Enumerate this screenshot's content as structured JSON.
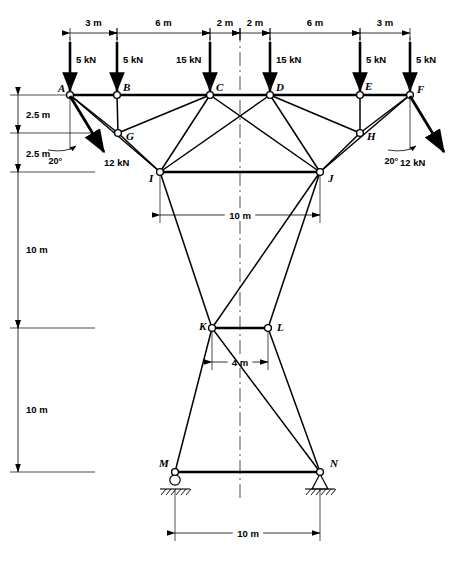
{
  "diagram": {
    "units": "m",
    "force_unit": "kN"
  },
  "joints": [
    {
      "id": "A",
      "label": "A",
      "x": 70,
      "y": 95,
      "label_dx": -12,
      "label_dy": -3
    },
    {
      "id": "B",
      "label": "B",
      "x": 117,
      "y": 95,
      "label_dx": 6,
      "label_dy": -4
    },
    {
      "id": "C",
      "label": "C",
      "x": 210,
      "y": 95,
      "label_dx": 6,
      "label_dy": -4
    },
    {
      "id": "D",
      "label": "D",
      "x": 270,
      "y": 95,
      "label_dx": 6,
      "label_dy": -4
    },
    {
      "id": "E",
      "label": "E",
      "x": 360,
      "y": 95,
      "label_dx": 5,
      "label_dy": -5
    },
    {
      "id": "F",
      "label": "F",
      "x": 410,
      "y": 95,
      "label_dx": 7,
      "label_dy": -2
    },
    {
      "id": "G",
      "label": "G",
      "x": 118,
      "y": 133,
      "label_dx": 8,
      "label_dy": 7
    },
    {
      "id": "H",
      "label": "H",
      "x": 360,
      "y": 133,
      "label_dx": 7,
      "label_dy": 7
    },
    {
      "id": "I",
      "label": "I",
      "x": 160,
      "y": 172,
      "label_dx": -11,
      "label_dy": 10
    },
    {
      "id": "J",
      "label": "J",
      "x": 320,
      "y": 172,
      "label_dx": 8,
      "label_dy": 10
    },
    {
      "id": "K",
      "label": "K",
      "x": 212,
      "y": 328,
      "label_dx": -13,
      "label_dy": 2
    },
    {
      "id": "L",
      "label": "L",
      "x": 268,
      "y": 328,
      "label_dx": 9,
      "label_dy": 3
    },
    {
      "id": "M",
      "label": "M",
      "x": 175,
      "y": 472,
      "label_dx": -16,
      "label_dy": -5
    },
    {
      "id": "N",
      "label": "N",
      "x": 320,
      "y": 472,
      "label_dx": 10,
      "label_dy": -5
    }
  ],
  "chord_members": [
    {
      "from": "A",
      "to": "B"
    },
    {
      "from": "B",
      "to": "C"
    },
    {
      "from": "C",
      "to": "D"
    },
    {
      "from": "D",
      "to": "E"
    },
    {
      "from": "E",
      "to": "F"
    },
    {
      "from": "I",
      "to": "J"
    },
    {
      "from": "K",
      "to": "L"
    },
    {
      "from": "M",
      "to": "N"
    }
  ],
  "web_members": [
    {
      "from": "A",
      "to": "G"
    },
    {
      "from": "A",
      "to": "I"
    },
    {
      "from": "B",
      "to": "G"
    },
    {
      "from": "G",
      "to": "C"
    },
    {
      "from": "G",
      "to": "I"
    },
    {
      "from": "C",
      "to": "I"
    },
    {
      "from": "C",
      "to": "J"
    },
    {
      "from": "D",
      "to": "I"
    },
    {
      "from": "D",
      "to": "J"
    },
    {
      "from": "D",
      "to": "H"
    },
    {
      "from": "E",
      "to": "H"
    },
    {
      "from": "F",
      "to": "H"
    },
    {
      "from": "F",
      "to": "J"
    },
    {
      "from": "H",
      "to": "J"
    },
    {
      "from": "I",
      "to": "K"
    },
    {
      "from": "J",
      "to": "L"
    },
    {
      "from": "J",
      "to": "K"
    },
    {
      "from": "K",
      "to": "M"
    },
    {
      "from": "K",
      "to": "N"
    },
    {
      "from": "L",
      "to": "N"
    }
  ],
  "vertical_loads": [
    {
      "joint": "A",
      "value": "5 kN",
      "x": 70,
      "label_x": 76,
      "label_y": 63
    },
    {
      "joint": "B",
      "value": "5 kN",
      "x": 117,
      "label_x": 123,
      "label_y": 63
    },
    {
      "joint": "C",
      "value": "15 kN",
      "x": 210,
      "label_x": 176,
      "label_y": 63
    },
    {
      "joint": "D",
      "value": "15 kN",
      "x": 270,
      "label_x": 276,
      "label_y": 63
    },
    {
      "joint": "E",
      "value": "5 kN",
      "x": 360,
      "label_x": 366,
      "label_y": 63
    },
    {
      "joint": "F",
      "value": "5 kN",
      "x": 410,
      "label_x": 416,
      "label_y": 63
    }
  ],
  "oblique_loads": [
    {
      "joint": "A",
      "value": "12 kN",
      "angle_label": "20°",
      "x1": 70,
      "y1": 96,
      "x2": 104,
      "y2": 152,
      "value_x": 104,
      "value_y": 166,
      "angle_x": 62,
      "angle_y": 152
    },
    {
      "joint": "F",
      "value": "12 kN",
      "angle_label": "20°",
      "x1": 410,
      "y1": 96,
      "x2": 444,
      "y2": 152,
      "value_x": 400,
      "value_y": 166,
      "angle_x": 398,
      "angle_y": 152
    }
  ],
  "top_dimensions": {
    "y_line": 33,
    "segments": [
      {
        "label": "3 m",
        "x1": 70,
        "x2": 117
      },
      {
        "label": "6 m",
        "x1": 117,
        "x2": 210
      },
      {
        "label": "2 m",
        "x1": 210,
        "x2": 240
      },
      {
        "label": "2 m",
        "x1": 240,
        "x2": 270
      },
      {
        "label": "6 m",
        "x1": 270,
        "x2": 360
      },
      {
        "label": "3 m",
        "x1": 360,
        "x2": 410
      }
    ]
  },
  "left_dimensions": {
    "x_line": 18,
    "segments": [
      {
        "label": "2.5 m",
        "y1": 95,
        "y2": 133,
        "label_y": 118,
        "tick_len": 95
      },
      {
        "label": "2.5 m",
        "y1": 133,
        "y2": 172,
        "label_y": 157,
        "tick_len": 95
      },
      {
        "label": "10 m",
        "y1": 172,
        "y2": 328,
        "label_y": 253,
        "tick_len": 95
      },
      {
        "label": "10 m",
        "y1": 328,
        "y2": 472,
        "label_y": 413,
        "tick_len": 95
      }
    ]
  },
  "internal_dimensions": [
    {
      "label": "10 m",
      "x1": 160,
      "x2": 320,
      "y": 215,
      "ext_from_y": 174,
      "text_x": 240,
      "text_y": 218
    },
    {
      "label": "4 m",
      "x1": 212,
      "x2": 268,
      "y": 362,
      "ext_from_y": 330,
      "text_x": 240,
      "text_y": 365
    },
    {
      "label": "10 m",
      "x1": 175,
      "x2": 320,
      "y": 533,
      "ext_from_y": 490,
      "text_x": 248,
      "text_y": 536
    }
  ],
  "centerline": {
    "x": 240,
    "y1": 28,
    "y2": 500
  },
  "supports": [
    {
      "joint": "M",
      "type": "roller",
      "x": 175,
      "y": 472
    },
    {
      "joint": "N",
      "type": "pin",
      "x": 320,
      "y": 472
    }
  ],
  "chart_data": {
    "type": "diagram",
    "subtype": "structural-truss",
    "nodes": {
      "A": [
        70,
        95
      ],
      "B": [
        117,
        95
      ],
      "C": [
        210,
        95
      ],
      "D": [
        270,
        95
      ],
      "E": [
        360,
        95
      ],
      "F": [
        410,
        95
      ],
      "G": [
        118,
        133
      ],
      "H": [
        360,
        133
      ],
      "I": [
        160,
        172
      ],
      "J": [
        320,
        172
      ],
      "K": [
        212,
        328
      ],
      "L": [
        268,
        328
      ],
      "M": [
        175,
        472
      ],
      "N": [
        320,
        472
      ]
    },
    "horizontal_spans_m": [
      3,
      6,
      2,
      2,
      6,
      3
    ],
    "vertical_spans_m": [
      2.5,
      2.5,
      10,
      10
    ],
    "internal_widths_m": {
      "IJ": 10,
      "KL": 4,
      "MN": 10
    },
    "point_loads_kN": {
      "A": 5,
      "B": 5,
      "C": 15,
      "D": 15,
      "E": 5,
      "F": 5
    },
    "inclined_loads_kN": {
      "A": 12,
      "F": 12
    },
    "inclined_load_angle_deg": 20,
    "support_types": {
      "M": "roller",
      "N": "pin"
    }
  }
}
